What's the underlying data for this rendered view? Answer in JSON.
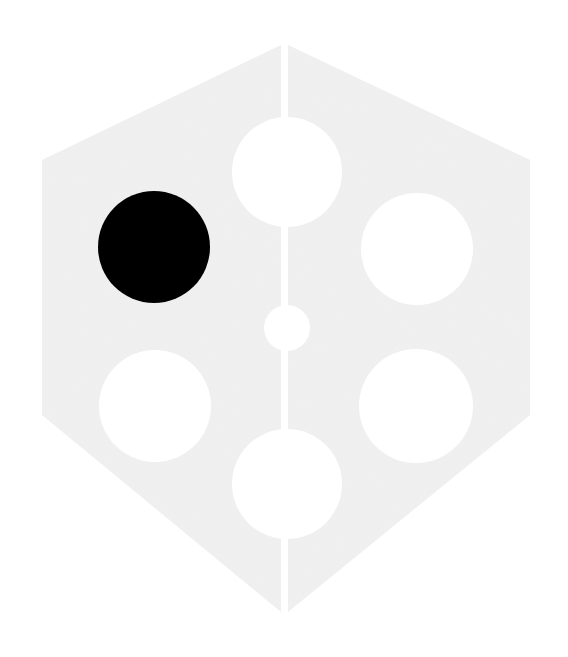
{
  "canvas": {
    "width": 568,
    "height": 657,
    "background": "#ffffff"
  },
  "hexagon": {
    "fill": "#eeeeee",
    "left_half": [
      [
        42,
        160
      ],
      [
        281,
        45
      ],
      [
        281,
        612
      ],
      [
        42,
        415
      ]
    ],
    "right_half": [
      [
        288,
        45
      ],
      [
        530,
        160
      ],
      [
        530,
        415
      ],
      [
        288,
        612
      ]
    ],
    "split_gap": {
      "x": 281,
      "width": 7,
      "color": "#ffffff"
    }
  },
  "circles": [
    {
      "name": "top-circle",
      "cx": 287,
      "cy": 172,
      "r": 55,
      "fill": "#ffffff"
    },
    {
      "name": "upper-left-circle",
      "cx": 154,
      "cy": 247,
      "r": 56,
      "fill": "#000000"
    },
    {
      "name": "upper-right-circle",
      "cx": 417,
      "cy": 249,
      "r": 56,
      "fill": "#ffffff"
    },
    {
      "name": "center-small-circle",
      "cx": 287,
      "cy": 328,
      "r": 23,
      "fill": "#ffffff"
    },
    {
      "name": "lower-left-circle",
      "cx": 155,
      "cy": 406,
      "r": 56,
      "fill": "#ffffff"
    },
    {
      "name": "lower-right-circle",
      "cx": 416,
      "cy": 406,
      "r": 57,
      "fill": "#ffffff"
    },
    {
      "name": "bottom-circle",
      "cx": 287,
      "cy": 484,
      "r": 55,
      "fill": "#ffffff"
    }
  ]
}
